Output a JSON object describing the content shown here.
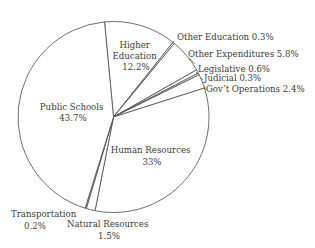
{
  "chart_data": {
    "type": "pie",
    "title": "",
    "start_angle_deg": -5.4,
    "direction": "clockwise",
    "center": [
      113.5,
      117
    ],
    "radius": 95.5,
    "slices": [
      {
        "label": "Higher Education",
        "value": 12.2,
        "display": [
          "Higher",
          "Education",
          "12.2%"
        ]
      },
      {
        "label": "Other Education",
        "value": 0.3,
        "display": [
          "Other Education 0.3%"
        ]
      },
      {
        "label": "Other Expenditures",
        "value": 5.8,
        "display": [
          "Other Expenditures 5.8%"
        ]
      },
      {
        "label": "Legislative",
        "value": 0.6,
        "display": [
          "Legislative 0.6%"
        ]
      },
      {
        "label": "Judicial",
        "value": 0.3,
        "display": [
          "Judicial 0.3%"
        ]
      },
      {
        "label": "Gov't Operations",
        "value": 2.4,
        "display": [
          "Gov’t Operations 2.4%"
        ]
      },
      {
        "label": "Human Resources",
        "value": 33,
        "display": [
          "Human Resources",
          "33%"
        ]
      },
      {
        "label": "Natural Resources",
        "value": 1.5,
        "display": [
          "Natural Resources",
          "1.5%"
        ]
      },
      {
        "label": "Transportation",
        "value": 0.2,
        "display": [
          "Transportation",
          "0.2%"
        ]
      },
      {
        "label": "Public Schools",
        "value": 43.7,
        "display": [
          "Public Schools",
          "43.7%"
        ]
      }
    ],
    "legend": null,
    "colors": {
      "fill": "#ffffff",
      "stroke": "#4a4a4a",
      "text": "#3a3a3a"
    }
  },
  "labels": {
    "higher_education": {
      "line1": "Higher",
      "line2": "Education",
      "line3": "12.2%"
    },
    "other_education": "Other Education 0.3%",
    "other_expenditures": "Other Expenditures 5.8%",
    "legislative": "Legislative 0.6%",
    "judicial": "Judicial 0.3%",
    "govt_operations": "Gov’t Operations 2.4%",
    "human_resources": {
      "line1": "Human Resources",
      "line2": "33%"
    },
    "natural_resources": {
      "line1": "Natural Resources",
      "line2": "1.5%"
    },
    "transportation": {
      "line1": "Transportation",
      "line2": "0.2%"
    },
    "public_schools": {
      "line1": "Public Schools",
      "line2": "43.7%"
    }
  }
}
